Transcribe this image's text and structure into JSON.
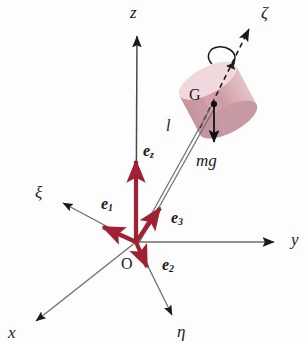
{
  "figure": {
    "background_color": "#fdfdfd"
  },
  "colors": {
    "vector_red": "#9e2233",
    "axis_black": "#1a1a1a",
    "axis_gray": "#6e6e6e",
    "body_rose": "#cf9ba4",
    "body_rose_light": "#f0d8dc",
    "body_rose_shadow": "#c08e98"
  },
  "axes": [
    {
      "name": "z-axis",
      "label": "z",
      "kind": "space-fixed",
      "from": [
        136,
        242
      ],
      "to": [
        137,
        30
      ],
      "label_pos": [
        130,
        6
      ],
      "color": "#4a4a4a"
    },
    {
      "name": "y-axis",
      "label": "y",
      "kind": "space-fixed",
      "from": [
        136,
        242
      ],
      "to": [
        281,
        242
      ],
      "label_pos": [
        292,
        232
      ],
      "color": "#4a4a4a"
    },
    {
      "name": "x-axis",
      "label": "x",
      "kind": "space-fixed",
      "from": [
        136,
        242
      ],
      "to": [
        30,
        327
      ],
      "label_pos": [
        9,
        326
      ],
      "color": "#4a4a4a"
    },
    {
      "name": "xi-axis",
      "label": "ξ",
      "kind": "body-fixed",
      "from": [
        136,
        242
      ],
      "to": [
        57,
        199
      ],
      "label_pos": [
        37,
        186
      ],
      "color": "#4a4a4a"
    },
    {
      "name": "eta-axis",
      "label": "η",
      "kind": "body-fixed",
      "from": [
        136,
        242
      ],
      "to": [
        175,
        322
      ],
      "label_pos": [
        178,
        326
      ],
      "color": "#4a4a4a"
    },
    {
      "name": "zeta-axis",
      "label": "ζ",
      "kind": "body-fixed-spin",
      "from": [
        205,
        111
      ],
      "to": [
        252,
        23
      ],
      "label_pos": [
        262,
        6
      ],
      "color": "#1a1a1a",
      "style": "dashed"
    }
  ],
  "vectors": [
    {
      "name": "e-z-vector",
      "label": "e",
      "subscript": "z",
      "from": [
        136,
        242
      ],
      "to": [
        136,
        155
      ],
      "label_pos": [
        144,
        145
      ]
    },
    {
      "name": "e-1-vector",
      "label": "e",
      "subscript": "1",
      "from": [
        136,
        242
      ],
      "to": [
        98,
        224
      ],
      "label_pos": [
        103,
        198
      ]
    },
    {
      "name": "e-2-vector",
      "label": "e",
      "subscript": "2",
      "from": [
        136,
        242
      ],
      "to": [
        150,
        272
      ],
      "label_pos": [
        163,
        259
      ]
    },
    {
      "name": "e-3-vector",
      "label": "e",
      "subscript": "3",
      "from": [
        136,
        242
      ],
      "to": [
        163,
        202
      ],
      "label_pos": [
        172,
        212
      ]
    },
    {
      "name": "mg-vector",
      "label": "mg",
      "subscript": "",
      "from": [
        214,
        104
      ],
      "to": [
        214,
        148
      ],
      "label_pos": [
        197,
        155
      ]
    }
  ],
  "points": [
    {
      "name": "origin-point",
      "label": "O",
      "pos": [
        136,
        242
      ],
      "label_pos": [
        122,
        258
      ]
    },
    {
      "name": "center-of-mass-point",
      "label": "G",
      "pos": [
        214,
        104
      ],
      "label_pos": [
        190,
        89
      ]
    }
  ],
  "segments": [
    {
      "name": "length-line-upper",
      "label": "l",
      "from": [
        136,
        242
      ],
      "to": [
        214,
        104
      ],
      "label_pos": [
        167,
        126
      ]
    },
    {
      "name": "length-line-lower",
      "label": "",
      "from": [
        136,
        242
      ],
      "to": [
        212,
        110
      ],
      "label_pos": [
        0,
        0
      ]
    }
  ],
  "body": {
    "name": "spinning-top-cylinder",
    "shape": "cylinder",
    "center": [
      218,
      100
    ],
    "tilt_deg": -28
  },
  "spin": {
    "name": "spin-rotation-arrow",
    "about": "ζ",
    "pos": [
      222,
      55
    ]
  }
}
